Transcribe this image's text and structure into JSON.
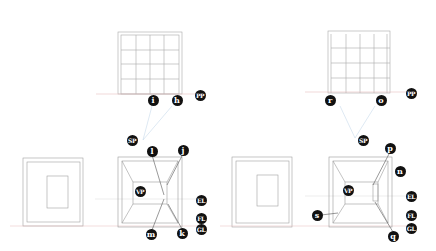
{
  "colors": {
    "pencil": "#9a9a9a",
    "pencil_light": "#c8c8c8",
    "red_line": "#e3a0a0",
    "blue_line": "#9ec3e0",
    "label_bg": "#111111",
    "label_fg": "#ffffff"
  },
  "left_figure": {
    "plan_labels": [
      {
        "id": "i",
        "text": "i",
        "x": 153,
        "y": 100
      },
      {
        "id": "h",
        "text": "h",
        "x": 177,
        "y": 100
      },
      {
        "id": "pp",
        "text": "PP",
        "x": 200,
        "y": 95
      }
    ],
    "sp_label": {
      "text": "SP",
      "x": 132,
      "y": 140
    },
    "perspective_labels": [
      {
        "id": "l",
        "text": "l",
        "x": 152,
        "y": 151
      },
      {
        "id": "j",
        "text": "j",
        "x": 183,
        "y": 150
      },
      {
        "id": "vp",
        "text": "VP",
        "x": 140,
        "y": 191
      },
      {
        "id": "el",
        "text": "EL",
        "x": 201,
        "y": 200
      },
      {
        "id": "fl",
        "text": "FL",
        "x": 201,
        "y": 218
      },
      {
        "id": "gl",
        "text": "GL",
        "x": 201,
        "y": 229
      },
      {
        "id": "m",
        "text": "m",
        "x": 151,
        "y": 234
      },
      {
        "id": "k",
        "text": "k",
        "x": 182,
        "y": 233
      }
    ]
  },
  "right_figure": {
    "plan_labels": [
      {
        "id": "r",
        "text": "r",
        "x": 330,
        "y": 100
      },
      {
        "id": "o",
        "text": "o",
        "x": 381,
        "y": 100
      },
      {
        "id": "pp",
        "text": "PP",
        "x": 411,
        "y": 93
      }
    ],
    "sp_label": {
      "text": "SP",
      "x": 363,
      "y": 140
    },
    "perspective_labels": [
      {
        "id": "p",
        "text": "p",
        "x": 390,
        "y": 148
      },
      {
        "id": "n",
        "text": "n",
        "x": 400,
        "y": 171
      },
      {
        "id": "vp",
        "text": "VP",
        "x": 348,
        "y": 190
      },
      {
        "id": "el",
        "text": "EL",
        "x": 411,
        "y": 196
      },
      {
        "id": "s",
        "text": "s",
        "x": 317,
        "y": 215
      },
      {
        "id": "fl",
        "text": "FL",
        "x": 411,
        "y": 215
      },
      {
        "id": "gl",
        "text": "GL",
        "x": 411,
        "y": 228
      },
      {
        "id": "q",
        "text": "q",
        "x": 393,
        "y": 236
      }
    ]
  }
}
